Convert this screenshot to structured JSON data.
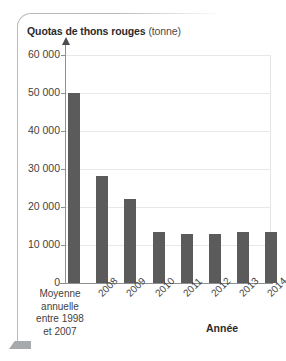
{
  "figure": {
    "title_strong": "Quotas de thons rouges",
    "title_light": "(tonne)",
    "axis_title_x": "Année",
    "category_block": {
      "line1": "Moyenne",
      "line2": "annuelle",
      "line3": "entre 1998",
      "line4": "et 2007"
    },
    "colors": {
      "bar": "#5b5b5b",
      "axis": "#8d9093",
      "grid": "#e8e8e8",
      "text": "#3f3f3f",
      "frame": "#b9bcbe",
      "frame_tab": "#a7aaac"
    }
  },
  "chart_data": {
    "type": "bar",
    "title": "Quotas de thons rouges (tonne)",
    "xlabel": "Année",
    "ylabel": "Quotas de thons rouges (tonne)",
    "ylim": [
      0,
      60000
    ],
    "ytick_labels": [
      "60 000",
      "50 000",
      "40 000",
      "30 000",
      "20 000",
      "10 000",
      "0"
    ],
    "ytick_values": [
      60000,
      50000,
      40000,
      30000,
      20000,
      10000,
      0
    ],
    "grid": true,
    "legend": null,
    "categories": [
      "Moyenne annuelle entre 1998 et 2007",
      "2008",
      "2009",
      "2010",
      "2011",
      "2012",
      "2013",
      "2014"
    ],
    "tick_labels": [
      "",
      "2008",
      "2009",
      "2010",
      "2011",
      "2012",
      "2013",
      "2014"
    ],
    "values": [
      50000,
      28200,
      22000,
      13500,
      12900,
      12900,
      13400,
      13400
    ]
  }
}
